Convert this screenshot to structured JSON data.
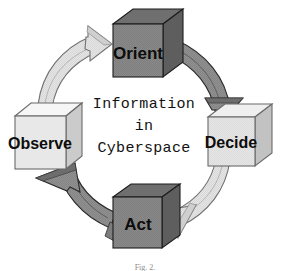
{
  "figure": {
    "caption": "Fig. 2.",
    "background_color": "#ffffff"
  },
  "center_text": {
    "line1": "Information",
    "line2": "in",
    "line3": "Cyberspace",
    "color": "#121212"
  },
  "nodes": [
    {
      "id": "orient",
      "label": "Orient",
      "position": "top",
      "shape": "cube",
      "face_color": "#8a8a8a",
      "top_color": "#6f6f6f",
      "side_color": "#5e5e5e",
      "edge_color": "#1c1c1c",
      "label_color": "#0d0d0d"
    },
    {
      "id": "decide",
      "label": "Decide",
      "position": "right",
      "shape": "cube",
      "face_color": "#dedede",
      "top_color": "#efefef",
      "side_color": "#c2c2c2",
      "edge_color": "#6a6a6a",
      "label_color": "#0d0d0d"
    },
    {
      "id": "act",
      "label": "Act",
      "position": "bottom",
      "shape": "cube",
      "face_color": "#8a8a8a",
      "top_color": "#6f6f6f",
      "side_color": "#5e5e5e",
      "edge_color": "#1c1c1c",
      "label_color": "#0d0d0d"
    },
    {
      "id": "observe",
      "label": "Observe",
      "position": "left",
      "shape": "cube",
      "face_color": "#e8e8e8",
      "top_color": "#f6f6f6",
      "side_color": "#cbcbcb",
      "edge_color": "#6a6a6a",
      "label_color": "#0d0d0d"
    }
  ],
  "arrows": [
    {
      "id": "observe-to-orient",
      "from": "observe",
      "to": "orient",
      "direction": "clockwise",
      "fill_color": "#e3e3e3",
      "shade_color": "#c6c6c6",
      "edge_color": "#707070"
    },
    {
      "id": "orient-to-decide",
      "from": "orient",
      "to": "decide",
      "direction": "clockwise",
      "fill_color": "#8f8f8f",
      "shade_color": "#6b6b6b",
      "edge_color": "#2a2a2a"
    },
    {
      "id": "decide-to-act",
      "from": "decide",
      "to": "act",
      "direction": "clockwise",
      "fill_color": "#e3e3e3",
      "shade_color": "#c6c6c6",
      "edge_color": "#707070"
    },
    {
      "id": "act-to-observe",
      "from": "act",
      "to": "observe",
      "direction": "clockwise",
      "fill_color": "#8f8f8f",
      "shade_color": "#6b6b6b",
      "edge_color": "#2a2a2a"
    }
  ]
}
